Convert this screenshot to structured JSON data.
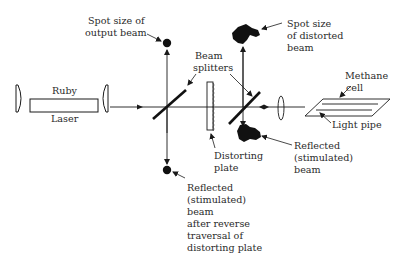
{
  "diagram": {
    "components": {
      "laser_top": "Ruby",
      "laser_bottom": "Laser",
      "beam_splitters": [
        "Beam",
        "splitters"
      ],
      "distorting_plate": [
        "Distorting",
        "plate"
      ],
      "methane_cell": [
        "Methane",
        "cell"
      ],
      "light_pipe": "Light pipe"
    },
    "annotations": {
      "output_spot": [
        "Spot size of",
        "output beam"
      ],
      "distorted_spot": [
        "Spot size",
        "of distorted",
        "beam"
      ],
      "reflected_beam": [
        "Reflected",
        "(stimulated)",
        "beam"
      ],
      "reflected_after_reverse": [
        "Reflected",
        "(stimulated)",
        "beam",
        "after reverse",
        "traversal of",
        "distorting plate"
      ]
    },
    "colors": {
      "line": "#1a1a1a",
      "text": "#2a2a2a",
      "background": "#ffffff"
    }
  }
}
